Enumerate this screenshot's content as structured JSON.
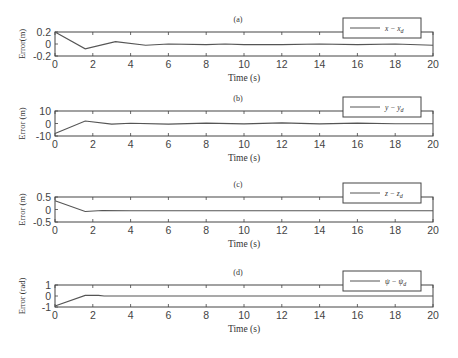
{
  "chart_data": [
    {
      "type": "line",
      "panel_label": "(a)",
      "xlabel": "Time (s)",
      "ylabel": "Error(m)",
      "xlim": [
        0,
        20
      ],
      "ylim": [
        -0.2,
        0.2
      ],
      "xticks": [
        0,
        2,
        4,
        6,
        8,
        10,
        12,
        14,
        16,
        18,
        20
      ],
      "yticks": [
        -0.2,
        0,
        0.2
      ],
      "ytick_labels": [
        "-0.2",
        "0",
        "0.2"
      ],
      "grid": false,
      "legend_position": "top-right",
      "series": [
        {
          "name": "x − x_d",
          "legend_main": "x − x",
          "legend_sub": "d",
          "x": [
            0,
            1.6,
            3.2,
            4.8,
            6,
            8,
            9,
            10,
            12,
            14,
            16,
            18,
            20
          ],
          "y": [
            0.2,
            -0.08,
            0.04,
            -0.02,
            0.0,
            -0.01,
            0.0,
            -0.01,
            -0.01,
            0.0,
            -0.01,
            0.0,
            -0.02
          ]
        }
      ]
    },
    {
      "type": "line",
      "panel_label": "(b)",
      "xlabel": "Time (s)",
      "ylabel": "Error (m)",
      "xlim": [
        0,
        20
      ],
      "ylim": [
        -10,
        10
      ],
      "xticks": [
        0,
        2,
        4,
        6,
        8,
        10,
        12,
        14,
        16,
        18,
        20
      ],
      "yticks": [
        -10,
        0,
        10
      ],
      "ytick_labels": [
        "-10",
        "0",
        "10"
      ],
      "grid": false,
      "legend_position": "top-right",
      "series": [
        {
          "name": "y − y_d",
          "legend_main": "y − y",
          "legend_sub": "d",
          "x": [
            0,
            1.6,
            3,
            4,
            6,
            8,
            10,
            12,
            14,
            16,
            18,
            20
          ],
          "y": [
            -8,
            2,
            -0.5,
            0.2,
            -0.5,
            0.3,
            -0.3,
            0.5,
            -0.3,
            0.3,
            -0.2,
            -0.2
          ]
        }
      ]
    },
    {
      "type": "line",
      "panel_label": "(c)",
      "xlabel": "Time (s)",
      "ylabel": "Error (m)",
      "xlim": [
        0,
        20
      ],
      "ylim": [
        -0.5,
        0.5
      ],
      "xticks": [
        0,
        2,
        4,
        6,
        8,
        10,
        12,
        14,
        16,
        18,
        20
      ],
      "yticks": [
        -0.5,
        0,
        0.5
      ],
      "ytick_labels": [
        "-0.5",
        "0",
        "0.5"
      ],
      "grid": false,
      "legend_position": "top-right",
      "series": [
        {
          "name": "z − z_d",
          "legend_main": "z − z",
          "legend_sub": "d",
          "x": [
            0,
            1.6,
            2.5,
            4,
            6,
            8,
            10,
            20
          ],
          "y": [
            0.35,
            -0.08,
            -0.04,
            -0.05,
            -0.05,
            -0.05,
            -0.05,
            -0.05
          ]
        }
      ]
    },
    {
      "type": "line",
      "panel_label": "(d)",
      "xlabel": "Time (s)",
      "ylabel": "Error (rad)",
      "xlim": [
        0,
        20
      ],
      "ylim": [
        -1,
        1
      ],
      "xticks": [
        0,
        2,
        4,
        6,
        8,
        10,
        12,
        14,
        16,
        18,
        20
      ],
      "yticks": [
        -1,
        0,
        1
      ],
      "ytick_labels": [
        "-1",
        "0",
        "1"
      ],
      "grid": false,
      "legend_position": "top-right",
      "series": [
        {
          "name": "ψ − ψ_d",
          "legend_main": "ψ − ψ",
          "legend_sub": "d",
          "x": [
            0,
            1.6,
            2.3,
            2.6,
            20
          ],
          "y": [
            -0.9,
            0.05,
            0.05,
            0.0,
            0.0
          ]
        }
      ]
    }
  ]
}
